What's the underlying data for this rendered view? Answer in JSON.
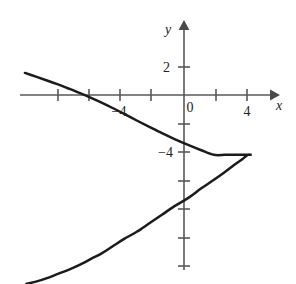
{
  "figure": {
    "kind": "cartesian-graph",
    "background_color": "#ffffff",
    "curve_color": "#1b1b1b",
    "axis_color": "#58585a",
    "label_color": "#232323"
  },
  "axes": {
    "x_axis_label": "x",
    "y_axis_label": "y",
    "origin_label": "0",
    "x_tick_labels": [
      {
        "value": -4,
        "text": "−4"
      },
      {
        "value": 4,
        "text": "4"
      }
    ],
    "y_tick_labels": [
      {
        "value": 2,
        "text": "2"
      },
      {
        "value": -4,
        "text": "−4"
      }
    ]
  },
  "chart_data": {
    "type": "line",
    "title": "",
    "subtitle": "",
    "xlabel": "x",
    "ylabel": "y",
    "xlim": [
      -10.4,
      5.9
    ],
    "ylim": [
      -13.3,
      5.1
    ],
    "grid": false,
    "legend": null,
    "annotations": [],
    "x_ticks": [
      -8,
      -6,
      -4,
      -2,
      0,
      2,
      4
    ],
    "x_tick_labels": [
      "",
      "",
      "−4",
      "",
      "0",
      "",
      "4"
    ],
    "y_ticks": [
      4,
      2,
      0,
      -2,
      -4,
      -6,
      -8,
      -10,
      -12
    ],
    "y_tick_labels": [
      "",
      "2",
      "",
      "",
      "−4",
      "",
      "",
      "",
      ""
    ],
    "series": [
      {
        "name": "sideways-parabola",
        "description": "Leftward-opening parabola with vertex at (4.3, -4.2), passing through (-4, 0)",
        "vertex": [
          4.3,
          -4.2
        ],
        "x_intercept": [
          -4,
          0
        ],
        "y_intercepts": [
          -1.05,
          -7.35
        ],
        "x": [
          -10.1,
          -9.4,
          -8.7,
          -8.0,
          -7.3,
          -6.6,
          -5.9,
          -5.2,
          -4.5,
          -3.8,
          -3.0,
          -2.2,
          -1.4,
          -0.6,
          0.3,
          1.1,
          1.9,
          2.6,
          3.2,
          3.7,
          4.05,
          4.25,
          4.3,
          4.25,
          4.05,
          3.7,
          3.2,
          2.6,
          1.9,
          1.1,
          0.3,
          -0.6,
          -1.4,
          -2.2,
          -3.0,
          -3.8,
          -4.5,
          -5.2,
          -5.9,
          -6.6,
          -7.3,
          -8.0,
          -8.7,
          -9.4,
          -10.0
        ],
        "y": [
          1.55,
          1.29,
          1.02,
          0.74,
          0.44,
          0.13,
          -0.2,
          -0.55,
          -0.93,
          -1.33,
          -1.79,
          -2.24,
          -2.68,
          -3.09,
          -3.52,
          -3.88,
          -4.2,
          -4.2,
          -4.2,
          -4.2,
          -4.2,
          -4.2,
          -4.2,
          -4.2,
          -4.2,
          -4.5,
          -4.9,
          -5.4,
          -5.95,
          -6.55,
          -7.2,
          -7.8,
          -8.4,
          -9.0,
          -9.6,
          -10.1,
          -10.6,
          -11.1,
          -11.5,
          -11.9,
          -12.25,
          -12.55,
          -12.85,
          -13.1,
          -13.25
        ]
      }
    ]
  }
}
